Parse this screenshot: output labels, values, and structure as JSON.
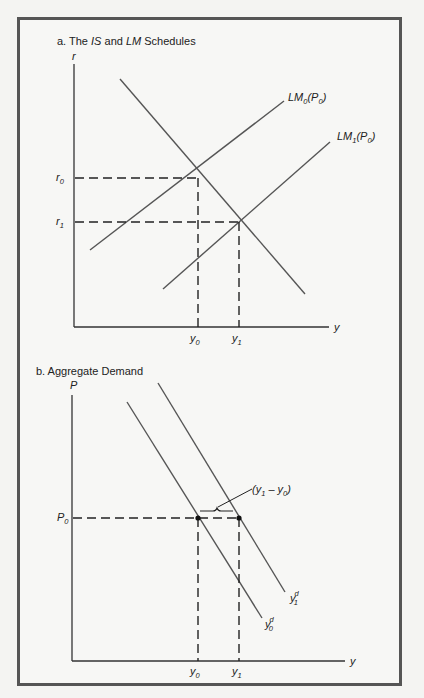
{
  "panel_a": {
    "title_prefix": "a.  The ",
    "title_is": "IS",
    "title_and": " and ",
    "title_lm": "LM",
    "title_suffix": " Schedules",
    "y_axis_label": "r",
    "x_axis_label": "y",
    "curves": [
      {
        "name": "IS",
        "label": ""
      },
      {
        "name": "LM0",
        "label_main": "LM",
        "label_sub": "0",
        "label_paren": "(P",
        "label_paren_sub": "0",
        "label_close": ")"
      },
      {
        "name": "LM1",
        "label_main": "LM",
        "label_sub": "1",
        "label_paren": "(P",
        "label_paren_sub": "0",
        "label_close": ")"
      }
    ],
    "y_ticks": [
      {
        "main": "r",
        "sub": "0"
      },
      {
        "main": "r",
        "sub": "1"
      }
    ],
    "x_ticks": [
      {
        "main": "y",
        "sub": "0"
      },
      {
        "main": "y",
        "sub": "1"
      }
    ]
  },
  "panel_b": {
    "title": "b.  Aggregate Demand",
    "y_axis_label": "P",
    "x_axis_label": "y",
    "curves": [
      {
        "name": "AD0",
        "label_main": "y",
        "label_sup": "d",
        "label_sub": "0"
      },
      {
        "name": "AD1",
        "label_main": "y",
        "label_sup": "d",
        "label_sub": "1"
      }
    ],
    "y_ticks": [
      {
        "main": "P",
        "sub": "0"
      }
    ],
    "x_ticks": [
      {
        "main": "y",
        "sub": "0"
      },
      {
        "main": "y",
        "sub": "1"
      }
    ],
    "annotation": {
      "open": "(y",
      "sub1": "1",
      "mid": " – y",
      "sub0": "0",
      "close": ")"
    }
  },
  "colors": {
    "frame": "#555555",
    "curve": "#555555",
    "axis": "#333333",
    "background": "#f7f7f5"
  }
}
